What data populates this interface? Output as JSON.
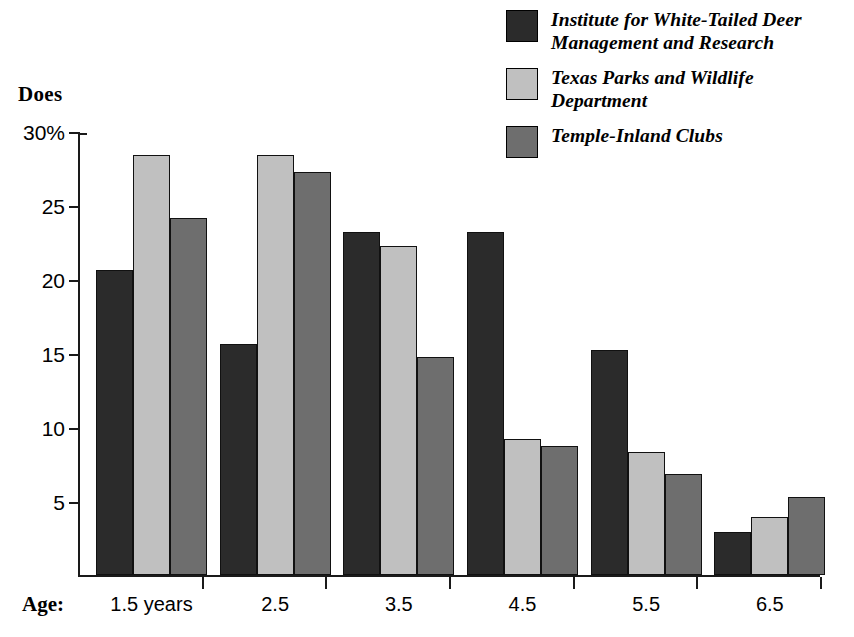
{
  "axis_title": "Does",
  "age_prefix": "Age:",
  "legend": {
    "items": [
      {
        "label": "Institute for White-Tailed Deer Management and Research",
        "color": "#2b2b2b",
        "swatch_name": "legend-swatch-institute"
      },
      {
        "label": "Texas Parks and Wildlife Department",
        "color": "#c0c0c0",
        "swatch_name": "legend-swatch-tpwd"
      },
      {
        "label": "Temple-Inland Clubs",
        "color": "#6e6e6e",
        "swatch_name": "legend-swatch-temple-inland"
      }
    ]
  },
  "chart_data": {
    "type": "bar",
    "title": "Does",
    "xlabel": "Age:",
    "ylabel": "Does",
    "ylim": [
      0,
      30
    ],
    "grid": false,
    "legend_position": "top-right",
    "ytick_labels": [
      "30%",
      "25",
      "20",
      "15",
      "10",
      "5"
    ],
    "ytick_values": [
      30,
      25,
      20,
      15,
      10,
      5
    ],
    "categories": [
      "1.5 years",
      "2.5",
      "3.5",
      "4.5",
      "5.5",
      "6.5"
    ],
    "series": [
      {
        "name": "Institute for White-Tailed Deer Management and Research",
        "color": "#2b2b2b",
        "values": [
          20.6,
          15.6,
          23.2,
          23.2,
          15.2,
          2.9
        ]
      },
      {
        "name": "Texas Parks and Wildlife Department",
        "color": "#c0c0c0",
        "values": [
          28.4,
          28.4,
          22.2,
          9.2,
          8.3,
          3.9
        ]
      },
      {
        "name": "Temple-Inland Clubs",
        "color": "#6e6e6e",
        "values": [
          24.1,
          27.2,
          14.7,
          8.7,
          6.8,
          5.3
        ]
      }
    ]
  }
}
